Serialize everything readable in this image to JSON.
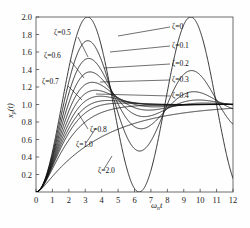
{
  "chart_data": {
    "type": "line",
    "title": "",
    "subtitle": "",
    "xlabel": "ωₙt",
    "xlabel_base": "ω",
    "xlabel_sub": "n",
    "xlabel_tail": "t",
    "ylabel": "xₚ(t)",
    "ylabel_base": "x",
    "ylabel_sub": "p",
    "ylabel_tail": "(t)",
    "xlim": [
      0,
      12
    ],
    "ylim": [
      0,
      2.0
    ],
    "xticks": [
      0,
      1,
      2,
      3,
      4,
      5,
      6,
      7,
      8,
      9,
      10,
      11,
      12
    ],
    "xticklabels": [
      "0",
      "1",
      "2",
      "3",
      "4",
      "5",
      "6",
      "7",
      "8",
      "9",
      "10",
      "11",
      "12"
    ],
    "yticks": [
      0.2,
      0.4,
      0.6,
      0.8,
      1.0,
      1.2,
      1.4,
      1.6,
      1.8,
      2.0
    ],
    "yticklabels": [
      "0.2",
      "0.4",
      "0.6",
      "0.8",
      "1.0",
      "1.2",
      "1.4",
      "1.6",
      "1.8",
      "2.0"
    ],
    "grid": false,
    "legend_position": "inline-annotations",
    "line_color": "#111111",
    "line_width": 0.85,
    "damping_ratios": [
      0,
      0.1,
      0.2,
      0.3,
      0.4,
      0.5,
      0.6,
      0.7,
      0.8,
      1.0,
      2.0
    ],
    "series": [
      {
        "name": "ζ=0",
        "zeta": 0
      },
      {
        "name": "ζ=0.1",
        "zeta": 0.1
      },
      {
        "name": "ζ=0.2",
        "zeta": 0.2
      },
      {
        "name": "ζ=0.3",
        "zeta": 0.3
      },
      {
        "name": "ζ=0.4",
        "zeta": 0.4
      },
      {
        "name": "ζ=0.5",
        "zeta": 0.5
      },
      {
        "name": "ζ=0.6",
        "zeta": 0.6
      },
      {
        "name": "ζ=0.7",
        "zeta": 0.7
      },
      {
        "name": "ζ=0.8",
        "zeta": 0.8
      },
      {
        "name": "ζ=1.0",
        "zeta": 1.0
      },
      {
        "name": "ζ=2.0",
        "zeta": 2.0
      }
    ],
    "annotations": [
      {
        "text": "ζ=0",
        "x": 172,
        "y": 29,
        "anchor": "start",
        "leader": [
          [
            170,
            27
          ],
          [
            118,
            36
          ]
        ]
      },
      {
        "text": "ζ=0.1",
        "x": 172,
        "y": 48,
        "anchor": "start",
        "leader": [
          [
            170,
            46
          ],
          [
            110,
            52
          ]
        ]
      },
      {
        "text": "ζ=0.2",
        "x": 172,
        "y": 66,
        "anchor": "start",
        "leader": [
          [
            170,
            64
          ],
          [
            104,
            68
          ]
        ]
      },
      {
        "text": "ζ=0.3",
        "x": 172,
        "y": 82,
        "anchor": "start",
        "leader": [
          [
            170,
            80
          ],
          [
            100,
            82
          ]
        ]
      },
      {
        "text": "ζ=0.4",
        "x": 172,
        "y": 98,
        "anchor": "start",
        "leader": [
          [
            170,
            96
          ],
          [
            96,
            94
          ]
        ]
      },
      {
        "text": "ζ=0.5",
        "x": 54,
        "y": 35,
        "anchor": "start",
        "leader": [
          [
            78,
            37
          ],
          [
            88,
            57
          ]
        ]
      },
      {
        "text": "ζ=0.6",
        "x": 44,
        "y": 58,
        "anchor": "start",
        "leader": [
          [
            70,
            60
          ],
          [
            84,
            78
          ]
        ]
      },
      {
        "text": "ζ=0.7",
        "x": 42,
        "y": 84,
        "anchor": "start",
        "leader": [
          [
            68,
            86
          ],
          [
            82,
            100
          ]
        ]
      },
      {
        "text": "ζ=0.8",
        "x": 90,
        "y": 132,
        "anchor": "start",
        "leader": [
          [
            88,
            129
          ],
          [
            78,
            113
          ]
        ]
      },
      {
        "text": "ζ=1.0",
        "x": 76,
        "y": 147,
        "anchor": "start",
        "leader": [
          [
            86,
            143
          ],
          [
            96,
            128
          ]
        ]
      },
      {
        "text": "ζ=2.0",
        "x": 98,
        "y": 173,
        "anchor": "start",
        "leader": [
          [
            104,
            169
          ],
          [
            112,
            156
          ]
        ]
      }
    ]
  },
  "plot_geometry": {
    "left": 36,
    "right": 233,
    "top": 17,
    "bottom": 192
  }
}
